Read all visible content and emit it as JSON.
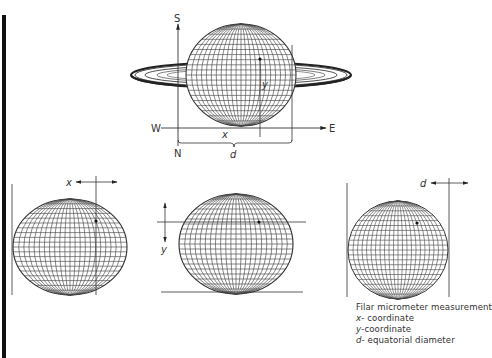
{
  "figure": {
    "title": "Filar micrometer measurement",
    "top_panel": {
      "axis_labels": {
        "south": "S",
        "north": "N",
        "west": "W",
        "east": "E"
      },
      "measure_labels": {
        "x": "x",
        "y": "y",
        "d": "d"
      }
    },
    "bottom_panels": [
      {
        "name": "x-measurement",
        "label": "x"
      },
      {
        "name": "y-measurement",
        "label": "y"
      },
      {
        "name": "d-measurement",
        "label": "d"
      }
    ],
    "legend": {
      "heading": "Filar micrometer measurement",
      "items": [
        {
          "symbol": "x",
          "text": "- coordinate"
        },
        {
          "symbol": "y",
          "text": "-coordinate"
        },
        {
          "symbol": "d",
          "text": "- equatorial diameter"
        }
      ]
    },
    "colors": {
      "line": "#333333",
      "grid": "#444444",
      "bar": "#111111",
      "background": "#ffffff"
    }
  }
}
